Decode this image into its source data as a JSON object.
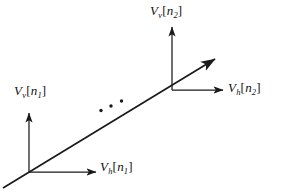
{
  "figure": {
    "title": "",
    "background_color": "#ffffff",
    "stroke_color": "#1a1a1a",
    "labels": {
      "v_top": {
        "base": "V",
        "sub": "v",
        "open": "[",
        "index": "n",
        "index_sub": "2",
        "close": "]",
        "text": "V_v[n_2]"
      },
      "h_right": {
        "base": "V",
        "sub": "h",
        "open": "[",
        "index": "n",
        "index_sub": "2",
        "close": "]",
        "text": "V_h[n_2]"
      },
      "v_left": {
        "base": "V",
        "sub": "v",
        "open": "[",
        "index": "n",
        "index_sub": "1",
        "close": "]",
        "text": "V_v[n_1]"
      },
      "h_bottom": {
        "base": "V",
        "sub": "h",
        "open": "[",
        "index": "n",
        "index_sub": "1",
        "close": "]",
        "text": "V_h[n_1]"
      }
    },
    "ellipsis": {
      "name": "diagonal-ellipsis",
      "dot_count": 3,
      "dots": [
        {
          "cx": 101,
          "cy": 110.5
        },
        {
          "cx": 111,
          "cy": 106
        },
        {
          "cx": 121.5,
          "cy": 101
        }
      ],
      "radius": 1.7
    },
    "nodes": [
      {
        "name": "node-n1",
        "x": 29,
        "y": 172
      },
      {
        "name": "node-n2",
        "x": 172,
        "y": 90
      }
    ],
    "arrows": [
      {
        "name": "arrow-v-n1",
        "x1": 29,
        "y1": 172,
        "x2": 29,
        "y2": 113
      },
      {
        "name": "arrow-h-n1",
        "x1": 29,
        "y1": 172,
        "x2": 96,
        "y2": 172
      },
      {
        "name": "arrow-v-n2",
        "x1": 172,
        "y1": 90,
        "x2": 172,
        "y2": 27
      },
      {
        "name": "arrow-h-n2",
        "x1": 172,
        "y1": 90,
        "x2": 223,
        "y2": 90
      },
      {
        "name": "arrow-diagonal",
        "x1": 3,
        "y1": 188,
        "x2": 215,
        "y2": 59
      }
    ]
  }
}
